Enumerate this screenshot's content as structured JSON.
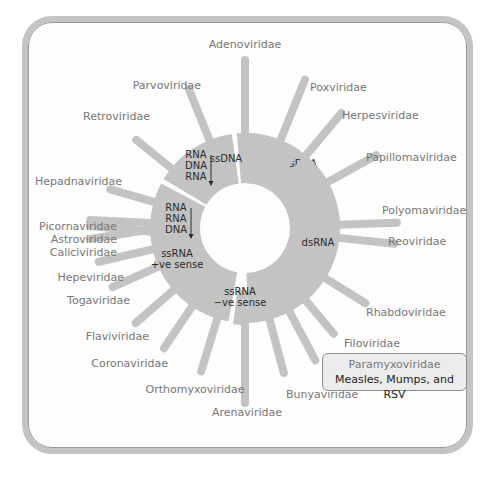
{
  "colors": {
    "ring": "#c3c3c3",
    "spoke": "#c3c3c3",
    "label": "#777777",
    "segment_text": "#2a2a2a",
    "frame": "#c4c4c4"
  },
  "center": {
    "x": 245,
    "y": 228,
    "r_inner": 45,
    "r_outer": 95
  },
  "segments": [
    {
      "id": "dsDNA",
      "label_lines": [
        "dsDNA"
      ],
      "start": -90,
      "end": 88,
      "label_x": 300,
      "label_y": 167
    },
    {
      "id": "dsRNA",
      "label_lines": [
        "dsRNA"
      ],
      "start": 88,
      "end": 97,
      "label_x": 318,
      "label_y": 246,
      "narrow": true
    },
    {
      "id": "ssRNA-neg",
      "label_lines": [
        "ssRNA",
        "−ve sense"
      ],
      "start": 100,
      "end": 208,
      "label_x": 240,
      "label_y": 300
    },
    {
      "id": "ssRNA-pos",
      "label_lines": [
        "ssRNA",
        "+ve sense"
      ],
      "start": 211,
      "end": 262,
      "label_x": 177,
      "label_y": 262
    },
    {
      "id": "RNA-RNA-DNA",
      "label_lines": [
        "RNA",
        "RNA",
        "DNA"
      ],
      "start": 265,
      "end": 285,
      "label_x": 176,
      "label_y": 222,
      "arrow": true
    },
    {
      "id": "RNA-DNA-RNA",
      "label_lines": [
        "RNA",
        "DNA",
        "RNA"
      ],
      "start": 288,
      "end": 306,
      "label_x": 196,
      "label_y": 169,
      "arrow": true
    },
    {
      "id": "ssDNA",
      "label_lines": [
        "ssDNA"
      ],
      "start": 309,
      "end": 357,
      "label_x": 226,
      "label_y": 162
    }
  ],
  "families": [
    {
      "name": "Adenoviridae",
      "angle": -90,
      "len": 168,
      "lx": 245,
      "ly": 48,
      "anchor": "middle"
    },
    {
      "name": "Poxviridae",
      "angle": -68,
      "len": 160,
      "lx": 310,
      "ly": 91,
      "anchor": "start"
    },
    {
      "name": "Herpesviridae",
      "angle": -50,
      "len": 150,
      "lx": 342,
      "ly": 119,
      "anchor": "start"
    },
    {
      "name": "Papillomaviridae",
      "angle": -29,
      "len": 150,
      "lx": 366,
      "ly": 161,
      "anchor": "start"
    },
    {
      "name": "Polyomaviridae",
      "angle": -2,
      "len": 152,
      "lx": 382,
      "ly": 214,
      "anchor": "start"
    },
    {
      "name": "Reoviridae",
      "angle": 6,
      "len": 150,
      "lx": 388,
      "ly": 245,
      "anchor": "start",
      "from_segment": "dsRNA"
    },
    {
      "name": "Rhabdoviridae",
      "angle": 32,
      "len": 142,
      "lx": 366,
      "ly": 316,
      "anchor": "start"
    },
    {
      "name": "Filoviridae",
      "angle": 50,
      "len": 138,
      "lx": 344,
      "ly": 347,
      "anchor": "start"
    },
    {
      "name": "Paramyxoviridae",
      "angle": 62,
      "len": 150,
      "lx": 0,
      "ly": 0,
      "anchor": "start",
      "callout": true
    },
    {
      "name": "Bunyaviridae",
      "angle": 75,
      "len": 150,
      "lx": 286,
      "ly": 398,
      "anchor": "start"
    },
    {
      "name": "Arenaviridae",
      "angle": 90,
      "len": 175,
      "lx": 247,
      "ly": 416,
      "anchor": "middle"
    },
    {
      "name": "Orthomyxoviridae",
      "angle": 107,
      "len": 150,
      "lx": 195,
      "ly": 393,
      "anchor": "middle"
    },
    {
      "name": "Coronaviridae",
      "angle": 124,
      "len": 145,
      "lx": 168,
      "ly": 367,
      "anchor": "end"
    },
    {
      "name": "Flaviviridae",
      "angle": 139,
      "len": 145,
      "lx": 149,
      "ly": 340,
      "anchor": "end"
    },
    {
      "name": "Togaviridae",
      "angle": 156,
      "len": 145,
      "lx": 130,
      "ly": 304,
      "anchor": "end"
    },
    {
      "name": "Hepeviridae",
      "angle": 167,
      "len": 150,
      "lx": 124,
      "ly": 281,
      "anchor": "end"
    },
    {
      "name": "Caliciviridae",
      "angle": 183,
      "len": 155,
      "lx": 117,
      "ly": 256,
      "anchor": "end"
    },
    {
      "name": "Astroviridae",
      "angle": 180,
      "len": 155,
      "lx": 117,
      "ly": 243,
      "anchor": "end",
      "y_off": 12
    },
    {
      "name": "Picornaviridae",
      "angle": 177,
      "len": 155,
      "lx": 117,
      "ly": 230,
      "anchor": "end",
      "y_off": 20
    },
    {
      "name": "Hepadnaviridae",
      "angle": 196,
      "len": 140,
      "lx": 122,
      "ly": 185,
      "anchor": "end"
    },
    {
      "name": "Retroviridae",
      "angle": 219,
      "len": 140,
      "lx": 150,
      "ly": 120,
      "anchor": "end"
    },
    {
      "name": "Parvoviridae",
      "angle": 248,
      "len": 150,
      "lx": 201,
      "ly": 89,
      "anchor": "end"
    }
  ],
  "callout": {
    "title": "Paramyxoviridae",
    "subtitle": "Measles, Mumps, and RSV"
  }
}
